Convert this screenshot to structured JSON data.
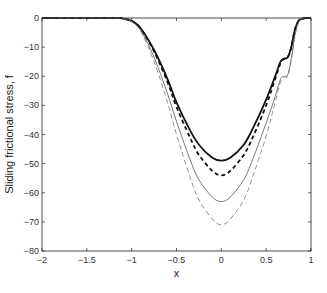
{
  "chart_data": {
    "type": "line",
    "title": "",
    "xlabel": "x",
    "ylabel": "Sliding frictional stress, f",
    "xlim": [
      -2,
      1
    ],
    "ylim": [
      -80,
      0
    ],
    "xticks": [
      -2,
      -1.5,
      -1,
      -0.5,
      0,
      0.5,
      1
    ],
    "xtick_labels": [
      "-2",
      "-1.5",
      "-1",
      "-0.5",
      "0",
      "0.5",
      "1"
    ],
    "yticks": [
      0,
      -10,
      -20,
      -30,
      -40,
      -50,
      -60,
      -70,
      -80
    ],
    "ytick_labels": [
      "0",
      "-10",
      "-20",
      "-30",
      "-40",
      "-50",
      "-60",
      "-70",
      "-80"
    ],
    "grid": false,
    "legend": null,
    "x": [
      -2,
      -1.2,
      -1.1,
      -1.0,
      -0.9,
      -0.75,
      -0.6,
      -0.5,
      -0.35,
      -0.25,
      -0.1,
      0,
      0.1,
      0.25,
      0.35,
      0.5,
      0.6,
      0.66,
      0.7,
      0.74,
      0.78,
      0.82,
      0.86,
      0.9,
      0.95,
      1
    ],
    "series": [
      {
        "name": "thick solid",
        "style": "solid",
        "width": 1.8,
        "color": "#111111",
        "values": [
          0,
          0,
          -0.2,
          -1,
          -3.5,
          -11,
          -21,
          -29,
          -38.5,
          -43.5,
          -48,
          -49,
          -48,
          -43.5,
          -38,
          -28,
          -20,
          -15,
          -14,
          -13.5,
          -10,
          -4,
          -1,
          -0.3,
          0,
          0
        ]
      },
      {
        "name": "thick dashed",
        "style": "dashed",
        "width": 1.8,
        "color": "#111111",
        "values": [
          0,
          0,
          -0.2,
          -1,
          -3.6,
          -11.5,
          -22,
          -30.5,
          -41,
          -47,
          -52.5,
          -54,
          -52.5,
          -47,
          -41,
          -30,
          -21,
          -15.5,
          -14,
          -13.5,
          -10,
          -4,
          -1,
          -0.3,
          0,
          0
        ]
      },
      {
        "name": "thin solid",
        "style": "solid",
        "width": 0.8,
        "color": "#555555",
        "values": [
          0,
          0,
          -0.2,
          -1.2,
          -4.2,
          -13.5,
          -26,
          -35.5,
          -48.5,
          -55.5,
          -61.5,
          -63,
          -61.5,
          -55.5,
          -48.5,
          -36,
          -27,
          -21,
          -20,
          -19.5,
          -14,
          -6,
          -1.5,
          -0.4,
          0,
          0
        ]
      },
      {
        "name": "thin dashed",
        "style": "dashed",
        "width": 0.8,
        "color": "#777777",
        "values": [
          0,
          0,
          -0.2,
          -1.3,
          -4.6,
          -15,
          -29,
          -40,
          -54.5,
          -62.5,
          -69,
          -71,
          -69,
          -62.5,
          -54.5,
          -40.5,
          -29,
          -22,
          -20.5,
          -20,
          -14.5,
          -6.5,
          -1.6,
          -0.4,
          0,
          0
        ]
      }
    ]
  },
  "plot_area": {
    "left": 42,
    "top": 18,
    "right": 311,
    "bottom": 251
  }
}
